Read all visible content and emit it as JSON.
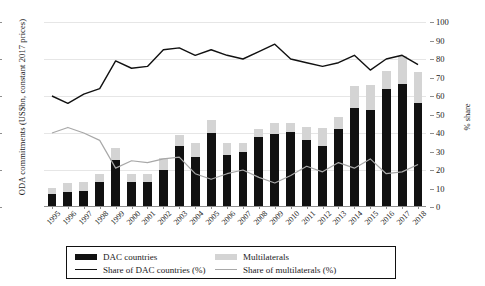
{
  "axes": {
    "left_title": "ODA commitments (US$bn, constant 2017 prices)",
    "right_title": "% share",
    "left_ticks": [
      "0",
      "5",
      "10",
      "15",
      "20",
      "25"
    ],
    "right_ticks": [
      "0",
      "10",
      "20",
      "30",
      "40",
      "50",
      "60",
      "70",
      "80",
      "90",
      "100"
    ]
  },
  "legend": {
    "dac_bar": "DAC countries",
    "multi_bar": "Multilaterals",
    "dac_line": "Share of DAC countries (%)",
    "multi_line": "Share of multilaterals (%)"
  },
  "colors": {
    "dac_bar": "#111111",
    "multi_bar": "#d4d4d4",
    "dac_line": "#111111",
    "multi_line": "#a8a8a8",
    "grid": "#e6e6e6",
    "axis": "#8f8f8f"
  },
  "chart_data": {
    "type": "bar",
    "title": "",
    "xlabel": "",
    "ylabel": "ODA commitments (US$bn, constant 2017 prices)",
    "y2label": "% share",
    "ylim": [
      0,
      25
    ],
    "y2lim": [
      0,
      100
    ],
    "grid": true,
    "legend_position": "bottom",
    "stacked": true,
    "categories": [
      "1995",
      "1996",
      "1997",
      "1998",
      "1999",
      "2000",
      "2001",
      "2002",
      "2003",
      "2004",
      "2005",
      "2006",
      "2007",
      "2008",
      "2009",
      "2010",
      "2011",
      "2012",
      "2013",
      "2014",
      "2015",
      "2016",
      "2017",
      "2018"
    ],
    "series": [
      {
        "name": "DAC countries",
        "type": "bar",
        "axis": "left",
        "values": [
          1.7,
          2.0,
          2.1,
          3.4,
          6.4,
          3.4,
          3.4,
          5.0,
          8.2,
          6.7,
          10.0,
          7.0,
          7.5,
          9.5,
          9.9,
          10.2,
          9.0,
          8.2,
          10.6,
          13.4,
          13.1,
          15.9,
          16.6,
          14.0
        ]
      },
      {
        "name": "Multilaterals",
        "type": "bar",
        "axis": "left",
        "values": [
          0.9,
          1.2,
          1.3,
          1.1,
          1.6,
          1.1,
          1.0,
          1.6,
          1.5,
          1.9,
          1.8,
          1.6,
          1.1,
          1.1,
          1.4,
          1.1,
          1.8,
          2.5,
          1.6,
          3.0,
          3.4,
          2.5,
          3.8,
          4.2
        ]
      },
      {
        "name": "Share of DAC countries (%)",
        "type": "line",
        "axis": "right",
        "values": [
          60,
          56,
          61,
          64,
          79,
          75,
          76,
          85,
          86,
          82,
          85,
          82,
          80,
          84,
          88,
          80,
          78,
          76,
          78,
          82,
          74,
          80,
          82,
          77
        ]
      },
      {
        "name": "Share of multilaterals (%)",
        "type": "line",
        "axis": "right",
        "values": [
          40,
          43,
          40,
          36,
          21,
          25,
          24,
          26,
          27,
          18,
          15,
          18,
          20,
          16,
          13,
          17,
          22,
          19,
          24,
          21,
          26,
          18,
          19,
          23
        ]
      }
    ]
  }
}
